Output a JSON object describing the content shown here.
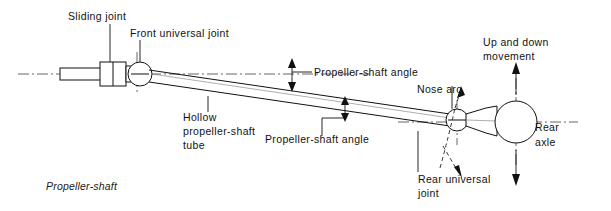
{
  "figure": {
    "caption": "Propeller-shaft",
    "colors": {
      "ink": "#111111",
      "centerline": "#555555",
      "background": "#ffffff"
    }
  },
  "labels": {
    "sliding_joint": "Sliding joint",
    "front_universal_joint": "Front universal joint",
    "propeller_shaft_angle_upper": "Propeller-shaft angle",
    "propeller_shaft_angle_lower": "Propeller-shaft angle",
    "hollow_tube_line1": "Hollow",
    "hollow_tube_line2": "propeller-shaft",
    "hollow_tube_line3": "tube",
    "nose_arc": "Nose arc",
    "up_and_down_line1": "Up and down",
    "up_and_down_line2": "movement",
    "rear_axle_line1": "Rear",
    "rear_axle_line2": "axle",
    "rear_universal_joint_line1": "Rear universal",
    "rear_universal_joint_line2": "joint"
  },
  "icons": {
    "arrow_up": "arrow-up-icon",
    "arrow_down": "arrow-down-icon",
    "dimension_arrow": "dimension-arrow-icon",
    "nose_arc_arrow": "curved-arrow-icon"
  }
}
